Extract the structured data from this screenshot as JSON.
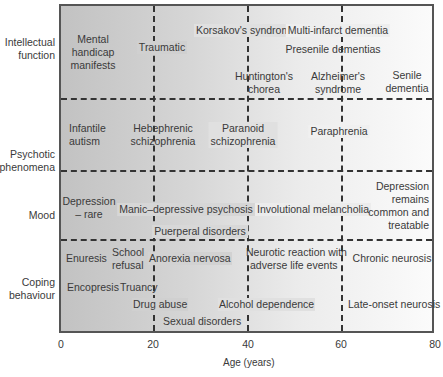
{
  "figure": {
    "type": "age-vs-disorder-category grid",
    "x_axis": {
      "label": "Age (years)",
      "ticks": [
        "0",
        "20",
        "40",
        "60",
        "80"
      ],
      "range": [
        0,
        80
      ]
    },
    "rows": [
      {
        "label": "Intellectual function",
        "label_lines": [
          "Intellectual",
          "function"
        ],
        "items": [
          {
            "lines": [
              "Mental",
              "handicap",
              "manifests"
            ]
          },
          {
            "lines": [
              "Traumatic"
            ]
          },
          {
            "lines": [
              "Korsakov's syndrome"
            ]
          },
          {
            "lines": [
              "Multi-infarct dementia"
            ]
          },
          {
            "lines": [
              "Presenile dementias"
            ]
          },
          {
            "lines": [
              "Huntington's",
              "chorea"
            ]
          },
          {
            "lines": [
              "Alzheimer's",
              "syndrome"
            ]
          },
          {
            "lines": [
              "Senile",
              "dementia"
            ]
          }
        ]
      },
      {
        "label": "Psychotic phenomena",
        "label_lines": [
          "Psychotic",
          "phenomena"
        ],
        "items": [
          {
            "lines": [
              "Infantile",
              "autism"
            ]
          },
          {
            "lines": [
              "Hebephrenic",
              "schizophrenia"
            ]
          },
          {
            "lines": [
              "Paranoid",
              "schizophrenia"
            ]
          },
          {
            "lines": [
              "Paraphrenia"
            ]
          }
        ]
      },
      {
        "label": "Mood",
        "label_lines": [
          "Mood"
        ],
        "items": [
          {
            "lines": [
              "Depression",
              "– rare"
            ]
          },
          {
            "lines": [
              "Manic–depressive psychosis"
            ]
          },
          {
            "lines": [
              "Puerperal disorders"
            ]
          },
          {
            "lines": [
              "Involutional melancholia"
            ]
          },
          {
            "lines": [
              "Depression",
              "remains",
              "common and",
              "treatable"
            ]
          }
        ]
      },
      {
        "label": "Coping behaviour",
        "label_lines": [
          "Coping",
          "behaviour"
        ],
        "items": [
          {
            "lines": [
              "Enuresis"
            ]
          },
          {
            "lines": [
              "School",
              "refusal"
            ]
          },
          {
            "lines": [
              "Anorexia nervosa"
            ]
          },
          {
            "lines": [
              "Neurotic reaction with",
              "adverse life events"
            ]
          },
          {
            "lines": [
              "Chronic neurosis"
            ]
          },
          {
            "lines": [
              "Encopresis"
            ]
          },
          {
            "lines": [
              "Truancy"
            ]
          },
          {
            "lines": [
              "Drug abuse"
            ]
          },
          {
            "lines": [
              "Alcohol dependence"
            ]
          },
          {
            "lines": [
              "Late-onset neurosis"
            ]
          },
          {
            "lines": [
              "Sexual disorders"
            ]
          }
        ]
      }
    ],
    "colors": {
      "gradient_left": "#c2c2c2",
      "gradient_right": "#fbfbfb",
      "border": "#555555",
      "dashes": "#333333",
      "text": "#3a3a3a"
    }
  }
}
